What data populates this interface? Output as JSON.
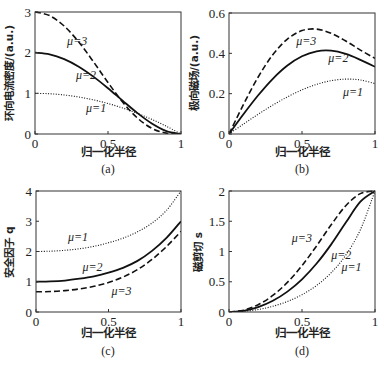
{
  "chart_data": [
    {
      "type": "line",
      "panel": "(a)",
      "caption": "(a)",
      "xlabel": "归一化半径",
      "ylabel": "环向电流密度/(a.u.)",
      "xlim": [
        0,
        1
      ],
      "ylim": [
        0,
        3
      ],
      "xticks": [
        "0",
        "0.5",
        "1"
      ],
      "yticks": [
        "0",
        "1",
        "2",
        "3"
      ],
      "grid": false,
      "x": [
        0,
        0.1,
        0.2,
        0.3,
        0.4,
        0.5,
        0.6,
        0.7,
        0.8,
        0.9,
        1.0
      ],
      "series": [
        {
          "name": "μ=1",
          "style": "dotted",
          "values": [
            1,
            0.99,
            0.96,
            0.91,
            0.84,
            0.75,
            0.64,
            0.51,
            0.36,
            0.19,
            0
          ],
          "label_pos": [
            0.35,
            0.55
          ]
        },
        {
          "name": "μ=2",
          "style": "solid",
          "values": [
            2,
            1.96,
            1.843,
            1.656,
            1.411,
            1.125,
            0.819,
            0.52,
            0.259,
            0.072,
            0
          ],
          "label_pos": [
            0.28,
            1.35
          ]
        },
        {
          "name": "μ=3",
          "style": "dashed",
          "values": [
            3,
            2.911,
            2.654,
            2.261,
            1.778,
            1.266,
            0.786,
            0.398,
            0.14,
            0.021,
            0
          ],
          "label_pos": [
            0.22,
            2.2
          ]
        }
      ]
    },
    {
      "type": "line",
      "panel": "(b)",
      "caption": "(b)",
      "xlabel": "归一化半径",
      "ylabel": "极向磁场/(a.u.)",
      "xlim": [
        0,
        1
      ],
      "ylim": [
        0,
        0.6
      ],
      "xticks": [
        "0",
        "0.5",
        "1"
      ],
      "yticks": [
        "0",
        "0.2",
        "0.4",
        "0.6"
      ],
      "grid": false,
      "x": [
        0,
        0.1,
        0.2,
        0.3,
        0.4,
        0.5,
        0.6,
        0.7,
        0.8,
        0.9,
        1.0
      ],
      "series": [
        {
          "name": "μ=1",
          "style": "dotted",
          "values": [
            0,
            0.0498,
            0.098,
            0.1433,
            0.184,
            0.2188,
            0.246,
            0.2643,
            0.272,
            0.2678,
            0.25
          ],
          "label_pos": [
            0.78,
            0.19
          ]
        },
        {
          "name": "μ=2",
          "style": "solid",
          "values": [
            0,
            0.099,
            0.192,
            0.2738,
            0.3394,
            0.3854,
            0.41,
            0.413,
            0.397,
            0.3678,
            0.3333
          ],
          "label_pos": [
            0.68,
            0.355
          ]
        },
        {
          "name": "μ=3",
          "style": "dashed",
          "values": [
            0,
            0.1478,
            0.2826,
            0.3929,
            0.4707,
            0.5127,
            0.5201,
            0.4994,
            0.4609,
            0.4161,
            0.375
          ],
          "label_pos": [
            0.46,
            0.44
          ]
        }
      ]
    },
    {
      "type": "line",
      "panel": "(c)",
      "caption": "(c)",
      "xlabel": "归一化半径",
      "ylabel": "安全因子 q",
      "xlim": [
        0,
        1
      ],
      "ylim": [
        0,
        4
      ],
      "xticks": [
        "0",
        "0.5",
        "1"
      ],
      "yticks": [
        "0",
        "1",
        "2",
        "3",
        "4"
      ],
      "grid": false,
      "x": [
        0,
        0.1,
        0.2,
        0.3,
        0.4,
        0.5,
        0.6,
        0.7,
        0.8,
        0.9,
        1.0
      ],
      "series": [
        {
          "name": "μ=1",
          "style": "dotted",
          "values": [
            2,
            2.01,
            2.04,
            2.09,
            2.17,
            2.29,
            2.44,
            2.65,
            2.94,
            3.36,
            4
          ],
          "label_pos": [
            0.22,
            2.35
          ]
        },
        {
          "name": "μ=2",
          "style": "solid",
          "values": [
            1,
            1.01,
            1.04,
            1.1,
            1.18,
            1.3,
            1.46,
            1.69,
            2.02,
            2.45,
            3
          ],
          "label_pos": [
            0.32,
            1.35
          ]
        },
        {
          "name": "μ=3",
          "style": "dashed",
          "values": [
            0.667,
            0.677,
            0.708,
            0.764,
            0.85,
            0.975,
            1.154,
            1.402,
            1.736,
            2.163,
            2.667
          ],
          "label_pos": [
            0.52,
            0.55
          ]
        }
      ]
    },
    {
      "type": "line",
      "panel": "(d)",
      "caption": "(d)",
      "xlabel": "归一化半径",
      "ylabel": "磁剪切 s",
      "xlim": [
        0,
        1
      ],
      "ylim": [
        0,
        2
      ],
      "xticks": [
        "0",
        "0.5",
        "1"
      ],
      "yticks": [
        "0",
        "0.5",
        "1",
        "1.5",
        "2"
      ],
      "grid": false,
      "x": [
        0,
        0.1,
        0.2,
        0.3,
        0.4,
        0.5,
        0.6,
        0.7,
        0.8,
        0.9,
        1.0
      ],
      "series": [
        {
          "name": "μ=1",
          "style": "dotted",
          "values": [
            0,
            0.01,
            0.041,
            0.094,
            0.174,
            0.286,
            0.439,
            0.649,
            0.941,
            1.361,
            2
          ],
          "label_pos": [
            0.77,
            0.68
          ]
        },
        {
          "name": "μ=2",
          "style": "solid",
          "values": [
            0,
            0.02,
            0.081,
            0.185,
            0.337,
            0.54,
            0.801,
            1.118,
            1.478,
            1.823,
            2
          ],
          "label_pos": [
            0.7,
            0.87
          ]
        },
        {
          "name": "μ=3",
          "style": "dashed",
          "values": [
            0,
            0.03,
            0.121,
            0.273,
            0.489,
            0.766,
            1.093,
            1.442,
            1.757,
            1.956,
            2
          ],
          "label_pos": [
            0.43,
            1.15
          ]
        }
      ]
    }
  ],
  "layout": {
    "panels": [
      {
        "left": 35,
        "top": 12,
        "right": 181,
        "bottom": 134
      },
      {
        "left": 229,
        "top": 13,
        "right": 375,
        "bottom": 134
      },
      {
        "left": 36,
        "top": 191,
        "right": 181,
        "bottom": 312
      },
      {
        "left": 229,
        "top": 191,
        "right": 375,
        "bottom": 312
      }
    ]
  }
}
